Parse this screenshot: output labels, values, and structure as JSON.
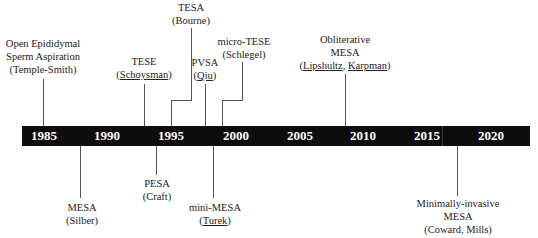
{
  "timeline": {
    "years": [
      "1985",
      "1990",
      "1995",
      "2000",
      "2005",
      "2010",
      "2015",
      "2020"
    ],
    "bar_color": "#0d0d0d",
    "year_color": "#ffffff"
  },
  "events_above": [
    {
      "lines": [
        "Open Epididymal",
        "Sperm Aspiration",
        "(Temple-Smith)"
      ],
      "underline_names": []
    },
    {
      "lines": [
        "TESE",
        "(Schoysman)"
      ],
      "underline_names": [
        "Schoysman"
      ]
    },
    {
      "lines": [
        "TESA",
        "(Bourne)"
      ],
      "underline_names": []
    },
    {
      "lines": [
        "PVSA",
        "(Qiu)"
      ],
      "underline_names": [
        "Qiu"
      ]
    },
    {
      "lines": [
        "micro-TESE",
        "(Schlegel)"
      ],
      "underline_names": []
    },
    {
      "lines": [
        "Obliterative",
        "MESA",
        "(Lipshultz, Karpman)"
      ],
      "underline_names": [
        "Lipshultz",
        "Karpman"
      ]
    }
  ],
  "events_below": [
    {
      "lines": [
        "MESA",
        "(Silber)"
      ],
      "underline_names": []
    },
    {
      "lines": [
        "PESA",
        "(Craft)"
      ],
      "underline_names": []
    },
    {
      "lines": [
        "mini-MESA",
        "(Turek)"
      ],
      "underline_names": [
        "Turek"
      ]
    },
    {
      "lines": [
        "Minimally-invasive",
        "MESA",
        "(Coward, Mills)"
      ],
      "underline_names": []
    }
  ],
  "text": {
    "temple_1": "Open Epididymal",
    "temple_2": "Sperm Aspiration",
    "temple_3": "(Temple-Smith)",
    "tese_1": "TESE",
    "tese_open": "(",
    "tese_name": "Schoysman",
    "tese_close": ")",
    "tesa_1": "TESA",
    "tesa_2": "(Bourne)",
    "pvsa_1": "PVSA",
    "pvsa_open": "(",
    "pvsa_name": "Qiu",
    "pvsa_close": ")",
    "mtese_1": "micro-TESE",
    "mtese_2": "(Schlegel)",
    "oblit_1": "Obliterative",
    "oblit_2": "MESA",
    "oblit_open": "(",
    "oblit_name1": "Lipshultz",
    "oblit_sep": ", ",
    "oblit_name2": "Karpman",
    "oblit_close": ")",
    "mesa_1": "MESA",
    "mesa_2": "(Silber)",
    "pesa_1": "PESA",
    "pesa_2": "(Craft)",
    "mini_1": "mini-MESA",
    "mini_open": "(",
    "mini_name": "Turek",
    "mini_close": ")",
    "mi_1": "Minimally-invasive",
    "mi_2": "MESA",
    "mi_3": "(Coward, Mills)"
  }
}
